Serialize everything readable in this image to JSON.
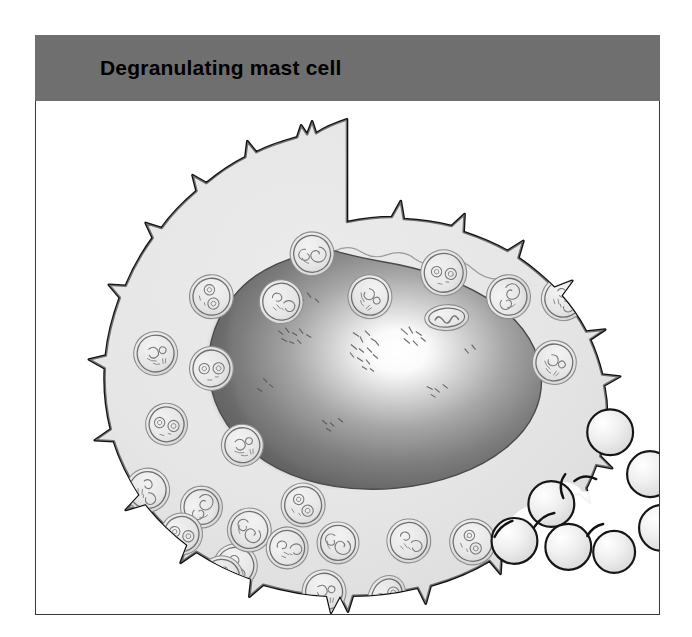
{
  "figure": {
    "title": "Degranulating mast cell",
    "header_bg": "#6f6f6f",
    "panel_bg": "#ffffff",
    "panel_border": "#3a3a3a"
  },
  "illustration": {
    "subject": "mast-cell",
    "cytoplasm_color": "#e4e4e4",
    "cytoplasm_edge_color": "#cfcfcf",
    "membrane_color": "#111111",
    "nucleus_dark": "#6c6c6c",
    "nucleus_mid": "#9a9a9a",
    "nucleus_highlight": "#ffffff",
    "granule_fill": "#e9e9e9",
    "granule_outline": "#6e6e6e",
    "released_granule_fill": "#efefef",
    "released_granule_outline": "#1a1a1a",
    "parts": [
      {
        "name": "plasma-membrane",
        "label": "Plasma membrane with microvilli"
      },
      {
        "name": "cytoplasm",
        "label": "Cytoplasm"
      },
      {
        "name": "nucleus",
        "label": "Nucleus"
      },
      {
        "name": "secretory-granules",
        "label": "Secretory granules"
      },
      {
        "name": "released-granules",
        "label": "Released granules"
      }
    ],
    "counts": {
      "internal_granules": 30,
      "released_granules": 8
    },
    "internal_granules": [
      {
        "cx": 277,
        "cy": 153,
        "r": 22,
        "rot": 12
      },
      {
        "cx": 409,
        "cy": 172,
        "r": 23,
        "rot": -25
      },
      {
        "cx": 176,
        "cy": 196,
        "r": 22,
        "rot": 40
      },
      {
        "cx": 246,
        "cy": 201,
        "r": 22,
        "rot": -10
      },
      {
        "cx": 335,
        "cy": 196,
        "r": 22,
        "rot": 70
      },
      {
        "cx": 474,
        "cy": 196,
        "r": 22,
        "rot": -50
      },
      {
        "cx": 529,
        "cy": 198,
        "r": 22,
        "rot": 20
      },
      {
        "cx": 412,
        "cy": 215,
        "r": 20,
        "rot": 0,
        "shape": "oval"
      },
      {
        "cx": 120,
        "cy": 253,
        "r": 22,
        "rot": 15
      },
      {
        "cx": 176,
        "cy": 268,
        "r": 22,
        "rot": -35
      },
      {
        "cx": 520,
        "cy": 262,
        "r": 22,
        "rot": 55
      },
      {
        "cx": 131,
        "cy": 324,
        "r": 21,
        "rot": -20
      },
      {
        "cx": 112,
        "cy": 390,
        "r": 22,
        "rot": 35
      },
      {
        "cx": 166,
        "cy": 407,
        "r": 21,
        "rot": -45
      },
      {
        "cx": 207,
        "cy": 345,
        "r": 21,
        "rot": 8
      },
      {
        "cx": 200,
        "cy": 466,
        "r": 22,
        "rot": 25
      },
      {
        "cx": 146,
        "cy": 492,
        "r": 21,
        "rot": -15
      },
      {
        "cx": 214,
        "cy": 540,
        "r": 22,
        "rot": 60
      },
      {
        "cx": 277,
        "cy": 503,
        "r": 21,
        "rot": -30
      },
      {
        "cx": 352,
        "cy": 500,
        "r": 21,
        "rot": 45
      },
      {
        "cx": 416,
        "cy": 505,
        "r": 22,
        "rot": -5
      },
      {
        "cx": 329,
        "cy": 560,
        "r": 22,
        "rot": 30
      },
      {
        "cx": 392,
        "cy": 570,
        "r": 21,
        "rot": -60
      },
      {
        "cx": 485,
        "cy": 530,
        "r": 22,
        "rot": 18
      },
      {
        "cx": 531,
        "cy": 498,
        "r": 22,
        "rot": -40
      },
      {
        "cx": 210,
        "cy": 600,
        "r": 0,
        "rot": 0
      }
    ],
    "released_granules": [
      {
        "cx": 576,
        "cy": 332,
        "r": 23,
        "state": "free"
      },
      {
        "cx": 616,
        "cy": 374,
        "r": 23,
        "state": "free"
      },
      {
        "cx": 628,
        "cy": 428,
        "r": 23,
        "state": "free"
      },
      {
        "cx": 517,
        "cy": 404,
        "r": 23,
        "state": "emerging"
      },
      {
        "cx": 480,
        "cy": 441,
        "r": 23,
        "state": "emerging"
      },
      {
        "cx": 534,
        "cy": 447,
        "r": 23,
        "state": "emerging"
      },
      {
        "cx": 578,
        "cy": 452,
        "r": 21,
        "state": "emerging"
      }
    ]
  }
}
